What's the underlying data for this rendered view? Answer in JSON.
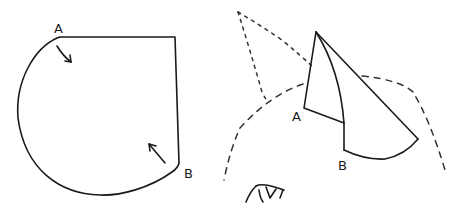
{
  "diagram": {
    "left_figure": {
      "label_a": "A",
      "label_b": "B",
      "description": "Flat pattern: quarter-circle-like sector with straight top edge and right edge, curved outline from A to B"
    },
    "right_figure": {
      "label_a": "A",
      "label_b": "B",
      "description": "Folded cone shape with dotted/dashed surrounding curves"
    },
    "colors": {
      "ink": "#1a1a1a",
      "background": "#ffffff"
    }
  }
}
